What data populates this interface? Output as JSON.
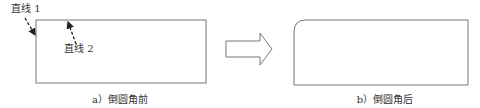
{
  "figure": {
    "panel_a": {
      "caption": "a）倒圆角前",
      "labels": {
        "line1": "直线 1",
        "line2": "直线 2"
      }
    },
    "panel_b": {
      "caption": "b）倒圆角后"
    },
    "colors": {
      "stroke": "#777777",
      "arrow_fill": "#ffffff",
      "text": "#333333",
      "leader": "#222222"
    }
  }
}
